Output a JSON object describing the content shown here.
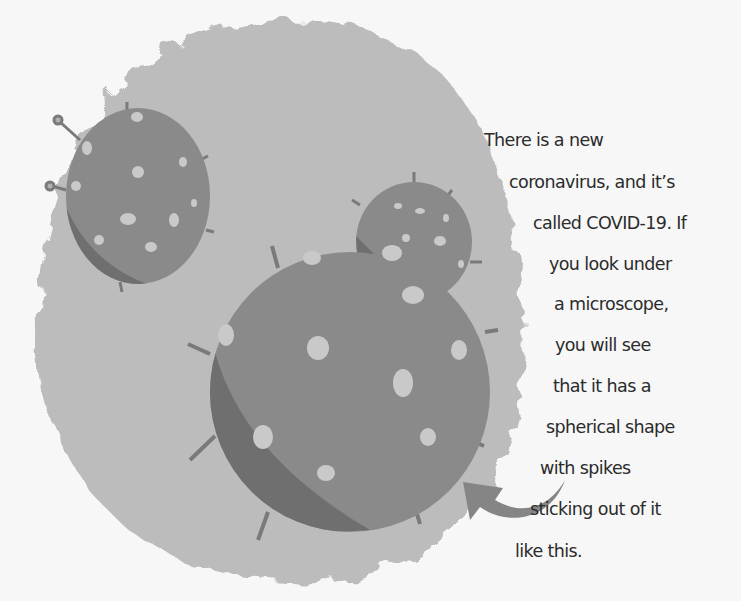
{
  "illustration": {
    "background_blob_color": "#b9b9b9",
    "sphere_color": "#8a8a8a",
    "sphere_shadow_color": "#6f6f6f",
    "spot_color": "#c9c9c9",
    "arrow_color": "#858585",
    "icons": [
      "virus-sphere-icon",
      "arrow-icon"
    ]
  },
  "text": {
    "lines": [
      "There is a new",
      "coronavirus, and it’s",
      "called COVID-19. If",
      "you look under",
      "a microscope,",
      "you will see",
      "that it has a",
      "spherical shape",
      "with spikes",
      "sticking out of it",
      "like this."
    ]
  }
}
